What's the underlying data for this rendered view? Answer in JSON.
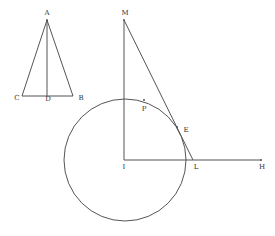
{
  "figure": {
    "labels": {
      "A": "A",
      "B": "B",
      "C": "C",
      "D": "D",
      "M": "M",
      "P": "P",
      "E": "E",
      "I": "I",
      "L": "L",
      "H": "H"
    }
  },
  "style": {
    "line_color": "#555555",
    "label_color": "#333333",
    "background": "#ffffff"
  }
}
